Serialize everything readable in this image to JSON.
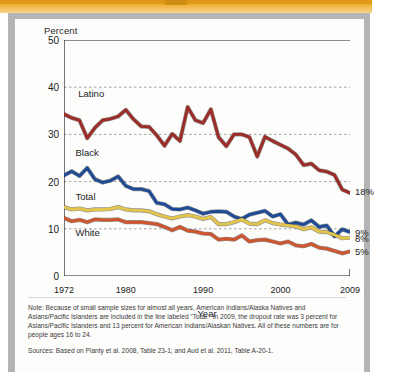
{
  "figure": {
    "y_axis_title": "Percent",
    "x_axis_title": "Year"
  },
  "notes": {
    "note": "Note: Because of small sample sizes for almost all years, American Indians/Alaska Natives and Asians/Pacific Islanders are included in the line labeled \"Total.\" In 2009, the dropout rate was 3 percent for Asians/Pacific Islanders and 13 percent for American Indians/Alaskan Natives. All of these numbers are for people ages 16 to 24.",
    "sources": "Sources: Based on Planty et al. 2008, Table 23-1; and Aud et al. 2011, Table A-20-1."
  },
  "colors": {
    "latino": "#9d2c26",
    "black": "#1f4b96",
    "total": "#e3c54b",
    "white": "#d1552c",
    "axis": "#1c1c1c",
    "grid": "#8c8c8c",
    "banner": "#eda520",
    "frame": "#b4b4b4"
  },
  "chart_data": {
    "type": "line",
    "title": "",
    "xlabel": "Year",
    "ylabel": "Percent",
    "xlim": [
      1972,
      2009
    ],
    "ylim": [
      0,
      50
    ],
    "yticks": [
      0,
      10,
      20,
      30,
      40,
      50
    ],
    "ytick_labels": [
      "0",
      "10",
      "20",
      "30",
      "40",
      "50"
    ],
    "xticks_labeled": [
      1972,
      1980,
      1990,
      2000,
      2009
    ],
    "xtick_labels": [
      "1972",
      "1980",
      "1990",
      "2000",
      "2009"
    ],
    "minor_xticks_every": 1,
    "grid": "horizontal-dashed at 10, 20, 30, 40",
    "legend_position": "inline-left-labels",
    "x": [
      1972,
      1973,
      1974,
      1975,
      1976,
      1977,
      1978,
      1979,
      1980,
      1981,
      1982,
      1983,
      1984,
      1985,
      1986,
      1987,
      1988,
      1989,
      1990,
      1991,
      1992,
      1993,
      1994,
      1995,
      1996,
      1997,
      1998,
      1999,
      2000,
      2001,
      2002,
      2003,
      2004,
      2005,
      2006,
      2007,
      2008,
      2009
    ],
    "series": [
      {
        "name": "Latino",
        "label": "Latino",
        "color": "#9d2c26",
        "end_label": "18%",
        "end_value": 18,
        "values": [
          34.3,
          33.5,
          33.0,
          29.2,
          31.4,
          33.0,
          33.3,
          33.8,
          35.2,
          33.2,
          31.7,
          31.6,
          29.8,
          27.6,
          30.1,
          28.6,
          35.8,
          33.0,
          32.4,
          35.3,
          29.4,
          27.5,
          30.0,
          30.0,
          29.4,
          25.3,
          29.5,
          28.6,
          27.8,
          27.0,
          25.7,
          23.5,
          23.8,
          22.4,
          22.1,
          21.4,
          18.3,
          17.6
        ]
      },
      {
        "name": "Black",
        "label": "Black",
        "color": "#1f4b96",
        "end_label": "9%",
        "end_value": 9,
        "values": [
          21.3,
          22.2,
          21.2,
          22.9,
          20.5,
          19.8,
          20.2,
          21.1,
          19.1,
          18.4,
          18.4,
          18.0,
          15.5,
          15.2,
          14.2,
          14.1,
          14.5,
          13.9,
          13.2,
          13.6,
          13.7,
          13.6,
          12.6,
          12.1,
          13.0,
          13.4,
          13.8,
          12.6,
          13.1,
          10.9,
          11.3,
          10.9,
          11.8,
          10.4,
          10.7,
          8.4,
          9.9,
          9.3
        ]
      },
      {
        "name": "Total",
        "label": "Total",
        "color": "#e3c54b",
        "end_label": "8%",
        "end_value": 8,
        "values": [
          14.6,
          14.1,
          14.3,
          13.9,
          14.1,
          14.1,
          14.2,
          14.6,
          14.1,
          13.9,
          13.9,
          13.7,
          13.1,
          12.6,
          12.2,
          12.6,
          12.9,
          12.6,
          12.1,
          12.5,
          11.0,
          11.0,
          11.4,
          12.0,
          11.1,
          11.0,
          11.8,
          11.2,
          10.9,
          10.7,
          10.5,
          9.9,
          10.3,
          9.4,
          9.3,
          8.7,
          8.0,
          8.1
        ]
      },
      {
        "name": "White",
        "label": "White",
        "color": "#d1552c",
        "end_label": "5%",
        "end_value": 5,
        "values": [
          12.3,
          11.6,
          11.9,
          11.4,
          12.0,
          11.9,
          11.9,
          12.0,
          11.4,
          11.4,
          11.4,
          11.2,
          11.0,
          10.4,
          9.7,
          10.4,
          9.6,
          9.4,
          9.0,
          8.9,
          7.7,
          7.9,
          7.7,
          8.6,
          7.3,
          7.6,
          7.7,
          7.3,
          6.9,
          7.3,
          6.5,
          6.3,
          6.8,
          6.0,
          5.8,
          5.3,
          4.8,
          5.2
        ]
      }
    ],
    "series_label_positions": [
      {
        "name": "Latino",
        "x_px_pct": 5,
        "y_value": 38.5
      },
      {
        "name": "Black",
        "x_px_pct": 4,
        "y_value": 26.0
      },
      {
        "name": "Total",
        "x_px_pct": 4,
        "y_value": 16.8
      },
      {
        "name": "White",
        "x_px_pct": 4,
        "y_value": 9.2
      }
    ]
  }
}
